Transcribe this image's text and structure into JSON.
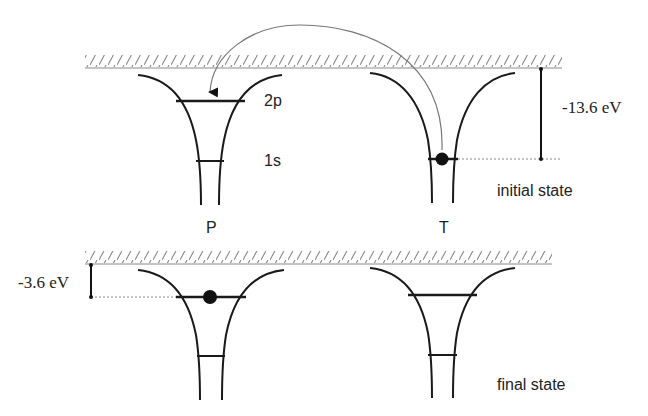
{
  "diagram": {
    "type": "energy-level diagram (electron capture between projectile and target)",
    "initial_state": {
      "label": "initial state",
      "energy_label": "-13.6 eV",
      "projectile_label": "P",
      "target_label": "T",
      "levels": {
        "upper": "2p",
        "lower": "1s"
      },
      "electron_position": "T 1s",
      "transition": "electron captured from T 1s into P 2p (curved arrow)"
    },
    "final_state": {
      "label": "final state",
      "energy_label": "-3.6 eV",
      "electron_position": "P 2p"
    },
    "colors": {
      "line": "#1a1a1a",
      "surface": "#888888",
      "arrow": "#777777"
    }
  }
}
